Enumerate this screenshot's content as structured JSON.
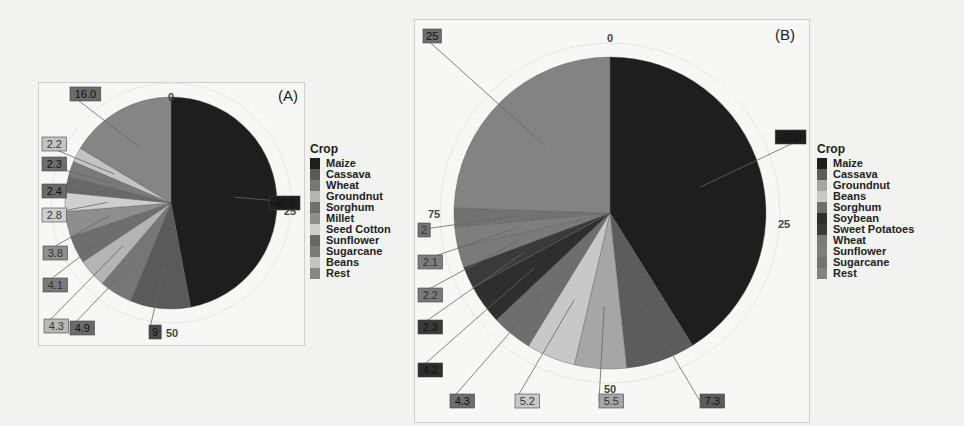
{
  "figure": {
    "panel_a_tag": "(A)",
    "panel_b_tag": "(B)"
  },
  "chart_data": [
    {
      "type": "pie",
      "title": "(A)",
      "legend_title": "Crop",
      "legend_position": "right",
      "angle_ticks": [
        "0",
        "25",
        "50",
        "75"
      ],
      "categories": [
        "Maize",
        "Cassava",
        "Wheat",
        "Groundnut",
        "Sorghum",
        "Millet",
        "Seed Cotton",
        "Sunflower",
        "Sugarcane",
        "Beans",
        "Rest"
      ],
      "values": [
        46.0,
        9,
        4.9,
        4.3,
        4.1,
        3.8,
        2.8,
        2.4,
        2.3,
        2.2,
        16.0
      ],
      "value_labels": [
        "46.0",
        "9",
        "4.9",
        "4.3",
        "4.1",
        "3.8",
        "2.8",
        "2.4",
        "2.3",
        "2.2",
        "16.0"
      ],
      "colors": [
        "#1e1e1e",
        "#5a5a5a",
        "#767676",
        "#b4b4b4",
        "#6e6e6e",
        "#8e8e8e",
        "#cfcfcf",
        "#686868",
        "#7a7a7a",
        "#c4c4c4",
        "#858585"
      ],
      "label_colors": [
        "#1e1e1e",
        "#4a4a4a",
        "#6a6a6a",
        "#b8b8b8",
        "#7a7a7a",
        "#8e8e8e",
        "#cfcfcf",
        "#6a6a6a",
        "#6e6e6e",
        "#c4c4c4",
        "#6a6a6a"
      ],
      "note": "Maize label value obscured in image; estimated as remainder (~46%)"
    },
    {
      "type": "pie",
      "title": "(B)",
      "legend_title": "Crop",
      "legend_position": "right",
      "angle_ticks": [
        "0",
        "25",
        "50",
        "75"
      ],
      "categories": [
        "Maize",
        "Cassava",
        "Groundnut",
        "Beans",
        "Sorghum",
        "Soybean",
        "Sweet Potatoes",
        "Wheat",
        "Sunflower",
        "Sugarcane",
        "Rest"
      ],
      "values": [
        42.0,
        7.3,
        5.5,
        5.2,
        4.3,
        4.2,
        2.3,
        2.2,
        2.1,
        2,
        25
      ],
      "value_labels": [
        "42.0",
        "7.3",
        "5.5",
        "5.2",
        "4.3",
        "4.2",
        "2.3",
        "2.2",
        "2.1",
        "2",
        "25"
      ],
      "colors": [
        "#1e1e1e",
        "#5c5c5c",
        "#a6a6a6",
        "#c8c8c8",
        "#6e6e6e",
        "#2e2e2e",
        "#3a3a3a",
        "#7a7a7a",
        "#7e7e7e",
        "#727272",
        "#838383"
      ],
      "label_colors": [
        "#1e1e1e",
        "#5c5c5c",
        "#a6a6a6",
        "#c8c8c8",
        "#6e6e6e",
        "#2e2e2e",
        "#3a3a3a",
        "#7a7a7a",
        "#7e7e7e",
        "#727272",
        "#6e6e6e"
      ],
      "note": "Maize label value obscured in image; estimated as remainder (~42%)"
    }
  ]
}
